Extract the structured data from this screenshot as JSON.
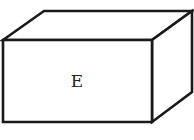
{
  "diagram": {
    "type": "3d-box",
    "front_face_label": "E",
    "stroke_color": "#1a1a1a",
    "fill_color": "#ffffff"
  }
}
